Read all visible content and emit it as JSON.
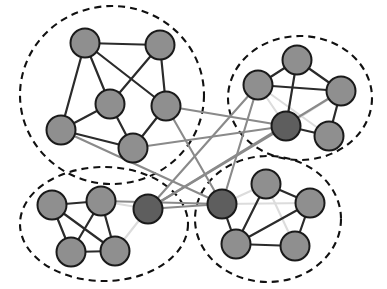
{
  "figure": {
    "width": 387,
    "height": 289,
    "background_color": "#ffffff"
  },
  "style": {
    "node_fill_normal": "#8f8f8f",
    "node_fill_dark": "#5e5e5e",
    "node_stroke": "#1a1a1a",
    "node_radius": 14.5,
    "edge_color_intra": "#2b2b2b",
    "edge_color_inter": "#8a8a8a",
    "edge_color_faint": "#dcdcdc",
    "boundary_color": "#111111",
    "boundary_dash": "7 5"
  },
  "clusters": [
    {
      "id": "cluster-1",
      "label": "top-left community",
      "shape": "ellipse",
      "cx": 112,
      "cy": 95,
      "rx": 92,
      "ry": 89,
      "rotation": 0,
      "node_count": 6
    },
    {
      "id": "cluster-2",
      "label": "top-right community",
      "shape": "ellipse",
      "cx": 300,
      "cy": 98,
      "rx": 72,
      "ry": 62,
      "rotation": 0,
      "node_count": 5
    },
    {
      "id": "cluster-3",
      "label": "bottom-left community",
      "shape": "ellipse",
      "cx": 104,
      "cy": 224,
      "rx": 84,
      "ry": 57,
      "rotation": 0,
      "node_count": 5
    },
    {
      "id": "cluster-4",
      "label": "bottom-right community",
      "shape": "ellipse",
      "cx": 268,
      "cy": 219,
      "rx": 73,
      "ry": 63,
      "rotation": 0,
      "node_count": 5
    }
  ],
  "nodes": [
    {
      "id": "n1",
      "cluster": "cluster-1",
      "x": 85,
      "y": 43,
      "shade": "normal"
    },
    {
      "id": "n2",
      "cluster": "cluster-1",
      "x": 160,
      "y": 45,
      "shade": "normal"
    },
    {
      "id": "n3",
      "cluster": "cluster-1",
      "x": 110,
      "y": 104,
      "shade": "normal"
    },
    {
      "id": "n4",
      "cluster": "cluster-1",
      "x": 166,
      "y": 106,
      "shade": "normal"
    },
    {
      "id": "n5",
      "cluster": "cluster-1",
      "x": 61,
      "y": 130,
      "shade": "normal"
    },
    {
      "id": "n6",
      "cluster": "cluster-1",
      "x": 133,
      "y": 148,
      "shade": "normal"
    },
    {
      "id": "n7",
      "cluster": "cluster-2",
      "x": 297,
      "y": 60,
      "shade": "normal"
    },
    {
      "id": "n8",
      "cluster": "cluster-2",
      "x": 258,
      "y": 85,
      "shade": "normal"
    },
    {
      "id": "n9",
      "cluster": "cluster-2",
      "x": 341,
      "y": 91,
      "shade": "normal"
    },
    {
      "id": "n10",
      "cluster": "cluster-2",
      "x": 286,
      "y": 126,
      "shade": "dark"
    },
    {
      "id": "n11",
      "cluster": "cluster-2",
      "x": 329,
      "y": 136,
      "shade": "normal"
    },
    {
      "id": "n12",
      "cluster": "cluster-3",
      "x": 52,
      "y": 205,
      "shade": "normal"
    },
    {
      "id": "n13",
      "cluster": "cluster-3",
      "x": 101,
      "y": 201,
      "shade": "normal"
    },
    {
      "id": "n14",
      "cluster": "cluster-3",
      "x": 148,
      "y": 209,
      "shade": "dark"
    },
    {
      "id": "n15",
      "cluster": "cluster-3",
      "x": 71,
      "y": 252,
      "shade": "normal"
    },
    {
      "id": "n16",
      "cluster": "cluster-3",
      "x": 115,
      "y": 251,
      "shade": "normal"
    },
    {
      "id": "n17",
      "cluster": "cluster-4",
      "x": 222,
      "y": 204,
      "shade": "dark"
    },
    {
      "id": "n18",
      "cluster": "cluster-4",
      "x": 266,
      "y": 184,
      "shade": "normal"
    },
    {
      "id": "n19",
      "cluster": "cluster-4",
      "x": 310,
      "y": 203,
      "shade": "normal"
    },
    {
      "id": "n20",
      "cluster": "cluster-4",
      "x": 236,
      "y": 244,
      "shade": "normal"
    },
    {
      "id": "n21",
      "cluster": "cluster-4",
      "x": 295,
      "y": 246,
      "shade": "normal"
    }
  ],
  "edges_intra": [
    {
      "source": "n1",
      "target": "n2"
    },
    {
      "source": "n1",
      "target": "n3"
    },
    {
      "source": "n1",
      "target": "n4"
    },
    {
      "source": "n1",
      "target": "n5"
    },
    {
      "source": "n2",
      "target": "n3"
    },
    {
      "source": "n2",
      "target": "n4"
    },
    {
      "source": "n3",
      "target": "n5"
    },
    {
      "source": "n3",
      "target": "n6"
    },
    {
      "source": "n4",
      "target": "n6"
    },
    {
      "source": "n5",
      "target": "n6"
    },
    {
      "source": "n7",
      "target": "n8"
    },
    {
      "source": "n7",
      "target": "n9"
    },
    {
      "source": "n7",
      "target": "n10"
    },
    {
      "source": "n8",
      "target": "n9"
    },
    {
      "source": "n9",
      "target": "n11"
    },
    {
      "source": "n10",
      "target": "n11"
    },
    {
      "source": "n12",
      "target": "n13"
    },
    {
      "source": "n12",
      "target": "n15"
    },
    {
      "source": "n12",
      "target": "n16"
    },
    {
      "source": "n13",
      "target": "n15"
    },
    {
      "source": "n13",
      "target": "n16"
    },
    {
      "source": "n15",
      "target": "n16"
    },
    {
      "source": "n17",
      "target": "n20"
    },
    {
      "source": "n18",
      "target": "n19"
    },
    {
      "source": "n18",
      "target": "n20"
    },
    {
      "source": "n19",
      "target": "n20"
    },
    {
      "source": "n19",
      "target": "n21"
    },
    {
      "source": "n20",
      "target": "n21"
    }
  ],
  "edges_faint": [
    {
      "source": "n8",
      "target": "n10"
    },
    {
      "source": "n8",
      "target": "n11"
    },
    {
      "source": "n9",
      "target": "n10"
    },
    {
      "source": "n13",
      "target": "n14"
    },
    {
      "source": "n14",
      "target": "n16"
    },
    {
      "source": "n17",
      "target": "n18"
    },
    {
      "source": "n17",
      "target": "n19"
    },
    {
      "source": "n18",
      "target": "n21"
    }
  ],
  "edges_inter": [
    {
      "source": "n4",
      "target": "n10",
      "from_cluster": "cluster-1",
      "to_cluster": "cluster-2"
    },
    {
      "source": "n4",
      "target": "n17",
      "from_cluster": "cluster-1",
      "to_cluster": "cluster-4"
    },
    {
      "source": "n6",
      "target": "n10",
      "from_cluster": "cluster-1",
      "to_cluster": "cluster-2"
    },
    {
      "source": "n5",
      "target": "n17",
      "from_cluster": "cluster-1",
      "to_cluster": "cluster-4"
    },
    {
      "source": "n8",
      "target": "n14",
      "from_cluster": "cluster-2",
      "to_cluster": "cluster-3"
    },
    {
      "source": "n8",
      "target": "n17",
      "from_cluster": "cluster-2",
      "to_cluster": "cluster-4"
    },
    {
      "source": "n10",
      "target": "n14",
      "from_cluster": "cluster-2",
      "to_cluster": "cluster-3"
    },
    {
      "source": "n13",
      "target": "n17",
      "from_cluster": "cluster-3",
      "to_cluster": "cluster-4"
    },
    {
      "source": "n14",
      "target": "n17",
      "from_cluster": "cluster-3",
      "to_cluster": "cluster-4"
    },
    {
      "source": "n9",
      "target": "n14",
      "from_cluster": "cluster-2",
      "to_cluster": "cluster-3"
    }
  ]
}
